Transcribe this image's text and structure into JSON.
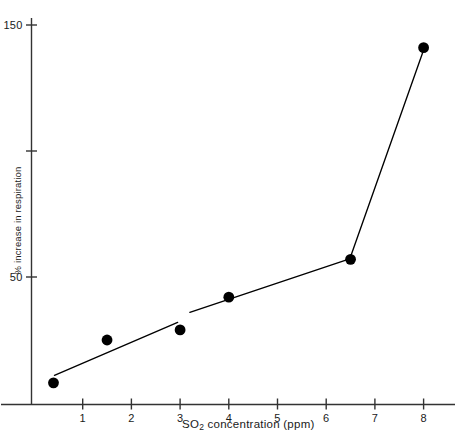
{
  "chart_data": {
    "type": "scatter",
    "title": "",
    "subtitle": "",
    "xlabel_prefix": "SO",
    "xlabel_sub": "2",
    "xlabel_suffix": " concentration (ppm)",
    "xlabel": "SO2 concentration (ppm)",
    "ylabel": "% increase in respiration",
    "xlim": [
      0,
      8.8
    ],
    "ylim": [
      0,
      158
    ],
    "xticks": [
      1,
      2,
      3,
      4,
      5,
      6,
      7,
      8
    ],
    "xtick_labels": [
      "1",
      "2",
      "3",
      "4",
      "5",
      "6",
      "7",
      "8"
    ],
    "yticks": [
      50,
      100,
      150
    ],
    "ytick_labels": [
      "50",
      "",
      "150"
    ],
    "grid": false,
    "legend": null,
    "marker": "filled-circle",
    "marker_color": "#000000",
    "line_color": "#000000",
    "axis_color": "#333333",
    "points": [
      {
        "x": 0.4,
        "y": 8
      },
      {
        "x": 1.5,
        "y": 25
      },
      {
        "x": 3.0,
        "y": 29
      },
      {
        "x": 4.0,
        "y": 42
      },
      {
        "x": 6.5,
        "y": 57
      },
      {
        "x": 8.0,
        "y": 141
      }
    ],
    "trend_segments": [
      {
        "from": {
          "x": 0.42,
          "y": 11
        },
        "to": {
          "x": 2.95,
          "y": 32
        }
      },
      {
        "from": {
          "x": 3.2,
          "y": 36
        },
        "to": {
          "x": 6.45,
          "y": 57
        }
      },
      {
        "from": {
          "x": 6.5,
          "y": 58
        },
        "to": {
          "x": 7.98,
          "y": 139
        }
      }
    ]
  }
}
